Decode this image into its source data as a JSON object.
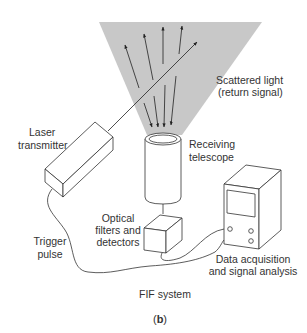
{
  "labels": {
    "scattered_light_1": "Scattered light",
    "scattered_light_2": "(return signal)",
    "laser_1": "Laser",
    "laser_2": "transmitter",
    "telescope_1": "Receiving",
    "telescope_2": "telescope",
    "optical_1": "Optical",
    "optical_2": "filters and",
    "optical_3": "detectors",
    "trigger_1": "Trigger",
    "trigger_2": "pulse",
    "daq_1": "Data acquisition",
    "daq_2": "and signal analysis",
    "system": "FIF system",
    "caption_open": "(",
    "caption_letter": "b",
    "caption_close": ")"
  },
  "colors": {
    "cone_fill": "#c8c8c8",
    "line": "#333333",
    "background": "#ffffff"
  }
}
